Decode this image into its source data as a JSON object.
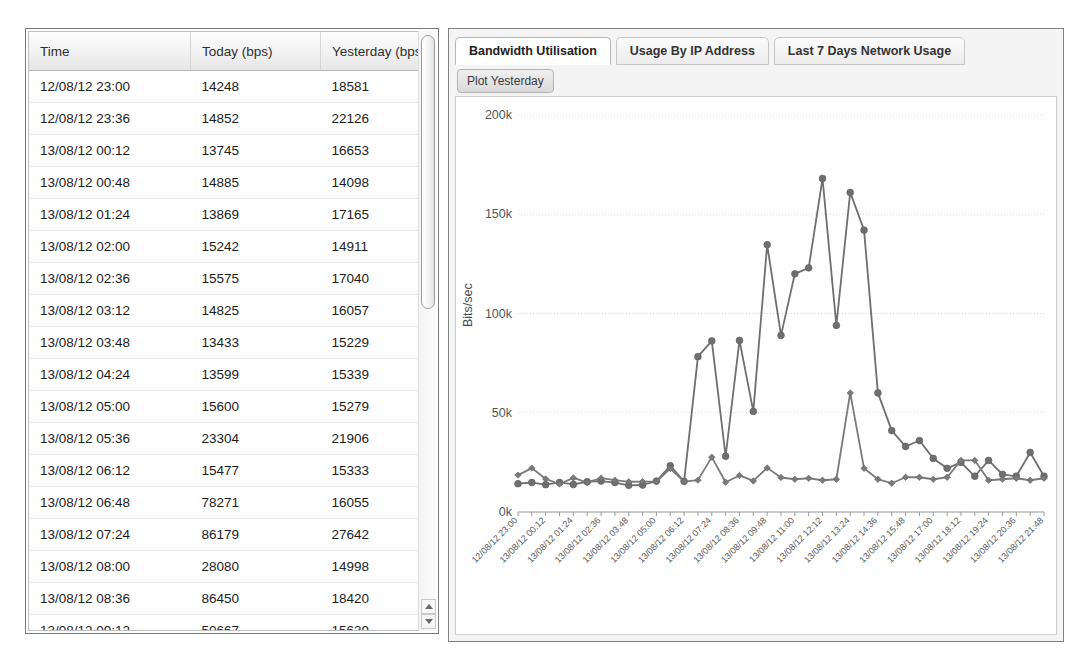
{
  "table": {
    "columns": [
      "Time",
      "Today (bps)",
      "Yesterday (bps)"
    ],
    "rows": [
      [
        "12/08/12 23:00",
        "14248",
        "18581"
      ],
      [
        "12/08/12 23:36",
        "14852",
        "22126"
      ],
      [
        "13/08/12 00:12",
        "13745",
        "16653"
      ],
      [
        "13/08/12 00:48",
        "14885",
        "14098"
      ],
      [
        "13/08/12 01:24",
        "13869",
        "17165"
      ],
      [
        "13/08/12 02:00",
        "15242",
        "14911"
      ],
      [
        "13/08/12 02:36",
        "15575",
        "17040"
      ],
      [
        "13/08/12 03:12",
        "14825",
        "16057"
      ],
      [
        "13/08/12 03:48",
        "13433",
        "15229"
      ],
      [
        "13/08/12 04:24",
        "13599",
        "15339"
      ],
      [
        "13/08/12 05:00",
        "15600",
        "15279"
      ],
      [
        "13/08/12 05:36",
        "23304",
        "21906"
      ],
      [
        "13/08/12 06:12",
        "15477",
        "15333"
      ],
      [
        "13/08/12 06:48",
        "78271",
        "16055"
      ],
      [
        "13/08/12 07:24",
        "86179",
        "27642"
      ],
      [
        "13/08/12 08:00",
        "28080",
        "14998"
      ],
      [
        "13/08/12 08:36",
        "86450",
        "18420"
      ],
      [
        "13/08/12 09:12",
        "50667",
        "15639"
      ],
      [
        "13/08/12 09:48",
        "134687",
        "22229"
      ],
      [
        "13/08/12 10:24",
        "88965",
        "17380"
      ]
    ],
    "scrollbar": {
      "up_icon": "triangle-up-icon",
      "down_icon": "triangle-down-icon"
    }
  },
  "chart_panel": {
    "tabs": [
      {
        "label": "Bandwidth Utilisation",
        "active": true
      },
      {
        "label": "Usage By IP Address",
        "active": false
      },
      {
        "label": "Last 7 Days Network Usage",
        "active": false
      }
    ],
    "plot_yesterday_button": "Plot Yesterday"
  },
  "chart_data": {
    "type": "line",
    "title": "",
    "xlabel": "",
    "ylabel": "Bits/sec",
    "ylim": [
      0,
      200000
    ],
    "yticks": [
      0,
      50000,
      100000,
      150000,
      200000
    ],
    "ytick_labels": [
      "0k",
      "50k",
      "100k",
      "150k",
      "200k"
    ],
    "grid": true,
    "legend": "none",
    "x": [
      "12/08/12 23:00",
      "12/08/12 23:36",
      "13/08/12 00:12",
      "13/08/12 00:48",
      "13/08/12 01:24",
      "13/08/12 02:00",
      "13/08/12 02:36",
      "13/08/12 03:12",
      "13/08/12 03:48",
      "13/08/12 04:24",
      "13/08/12 05:00",
      "13/08/12 05:36",
      "13/08/12 06:12",
      "13/08/12 06:48",
      "13/08/12 07:24",
      "13/08/12 08:00",
      "13/08/12 08:36",
      "13/08/12 09:12",
      "13/08/12 09:48",
      "13/08/12 10:24",
      "13/08/12 11:00",
      "13/08/12 11:36",
      "13/08/12 12:12",
      "13/08/12 12:48",
      "13/08/12 13:24",
      "13/08/12 14:00",
      "13/08/12 14:36",
      "13/08/12 15:12",
      "13/08/12 15:48",
      "13/08/12 16:24",
      "13/08/12 17:00",
      "13/08/12 17:36",
      "13/08/12 18:12",
      "13/08/12 18:48",
      "13/08/12 19:24",
      "13/08/12 20:00",
      "13/08/12 20:36",
      "13/08/12 21:12",
      "13/08/12 21:48"
    ],
    "xtick_labels": [
      "12/08/12 23:00",
      "13/08/12 00:12",
      "13/08/12 01:24",
      "13/08/12 02:36",
      "13/08/12 03:48",
      "13/08/12 05:00",
      "13/08/12 06:12",
      "13/08/12 07:24",
      "13/08/12 08:36",
      "13/08/12 09:48",
      "13/08/12 11:00",
      "13/08/12 12:12",
      "13/08/12 13:24",
      "13/08/12 14:36",
      "13/08/12 15:48",
      "13/08/12 17:00",
      "13/08/12 18:12",
      "13/08/12 19:24",
      "13/08/12 20:36",
      "13/08/12 21:48"
    ],
    "series": [
      {
        "name": "Today",
        "color": "#6f6f6f",
        "marker": "circle",
        "values": [
          14248,
          14852,
          13745,
          14885,
          13869,
          15242,
          15575,
          14825,
          13433,
          13599,
          15600,
          23304,
          15477,
          78271,
          86179,
          28080,
          86450,
          50667,
          134687,
          88965,
          120000,
          123000,
          168000,
          94000,
          161000,
          142000,
          60000,
          41000,
          33000,
          36000,
          27000,
          22000,
          25000,
          18000,
          26000,
          19000,
          18000,
          30000,
          18000
        ]
      },
      {
        "name": "Yesterday",
        "color": "#7a7a7a",
        "marker": "diamond",
        "values": [
          18581,
          22126,
          16653,
          14098,
          17165,
          14911,
          17040,
          16057,
          15229,
          15339,
          15279,
          21906,
          15333,
          16055,
          27642,
          14998,
          18420,
          15639,
          22229,
          17380,
          16500,
          17000,
          16000,
          16500,
          60000,
          22000,
          16500,
          14500,
          17500,
          17500,
          16500,
          17500,
          26000,
          26000,
          16000,
          16500,
          17000,
          16000,
          17000
        ]
      }
    ]
  }
}
